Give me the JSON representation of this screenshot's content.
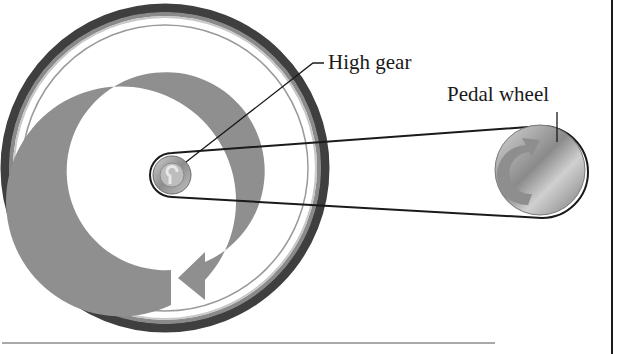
{
  "labels": {
    "high_gear": "High gear",
    "pedal_wheel": "Pedal wheel"
  },
  "components": {
    "large_wheel": {
      "center": [
        165,
        168
      ],
      "outer_radius": 163,
      "description": "large rear wheel with tire and rotation arrow"
    },
    "high_gear": {
      "center": [
        172,
        175
      ],
      "radius": 20
    },
    "pedal_wheel": {
      "center": [
        540,
        170
      ],
      "radius": 46
    },
    "belt": {
      "connects": [
        "high_gear",
        "pedal_wheel"
      ]
    }
  },
  "icons": {
    "rotation_arrow_large": "counterclockwise-arrow",
    "rotation_arrow_small": "rotation-arrow"
  },
  "colors": {
    "tire_dark": "#3a3a3a",
    "arrow_gray": "#8e8e8e",
    "metal": "#b8b8b8",
    "line": "#1a1a1a"
  }
}
